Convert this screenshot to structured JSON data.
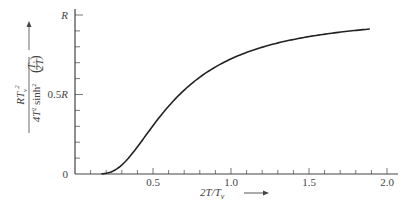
{
  "chart_data": {
    "type": "line",
    "title": "",
    "xlabel": "2T/T_v",
    "ylabel": "RT_v^2 / (4T^2 sinh^2(T_v/2T))",
    "xlim": [
      0,
      2.05
    ],
    "ylim": [
      0,
      1.0
    ],
    "grid": false,
    "legend": null,
    "x_ticks": [
      "0.5",
      "1.0",
      "1.5",
      "2.0"
    ],
    "x_tick_values": [
      0.5,
      1.0,
      1.5,
      2.0
    ],
    "x_minor_step": 0.1,
    "y_ticks": [
      "0",
      "0.5R",
      "R"
    ],
    "y_tick_values": [
      0,
      0.5,
      1.0
    ],
    "y_minor_step": 0.1,
    "series": [
      {
        "name": "Einstein heat capacity function",
        "x": [
          0.17,
          0.2,
          0.25,
          0.3,
          0.35,
          0.4,
          0.45,
          0.5,
          0.6,
          0.7,
          0.8,
          0.9,
          1.0,
          1.1,
          1.2,
          1.3,
          1.4,
          1.5,
          1.6,
          1.7,
          1.8,
          1.89
        ],
        "values": [
          0.0,
          0.005,
          0.022,
          0.057,
          0.108,
          0.168,
          0.236,
          0.304,
          0.432,
          0.539,
          0.622,
          0.681,
          0.724,
          0.762,
          0.794,
          0.821,
          0.843,
          0.862,
          0.876,
          0.888,
          0.898,
          0.905
        ]
      }
    ]
  },
  "axes": {
    "y_top_label": "R",
    "y_mid_label": "0.5",
    "y_mid_label_R": "R",
    "y_zero_label": "0",
    "x_labels": [
      "0.5",
      "1.0",
      "1.5",
      "2.0"
    ],
    "x_axis_title_main": "2T/T",
    "x_axis_title_sub": "v",
    "y_axis_numerator": "RT",
    "y_axis_numerator_sub": "v",
    "y_axis_numerator_sup": "2",
    "y_axis_denominator_a": "4T",
    "y_axis_denominator_sup": "2",
    "y_axis_denominator_b": " sinh",
    "y_axis_denominator_sup2": "2",
    "y_axis_frac_top": "T",
    "y_axis_frac_top_sub": "v",
    "y_axis_frac_bottom": "2T"
  }
}
